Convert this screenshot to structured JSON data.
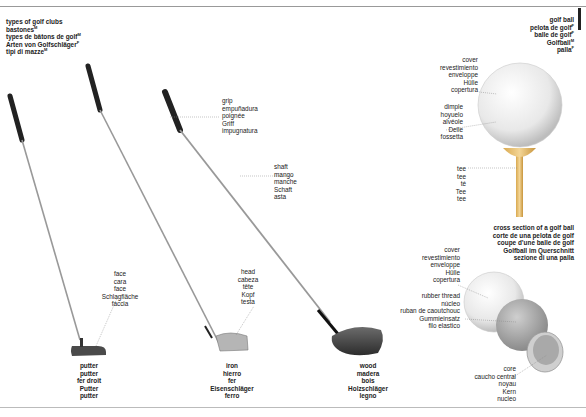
{
  "page_number": "golf",
  "title": {
    "lines": [
      {
        "text": "types of golf clubs",
        "gender": ""
      },
      {
        "text": "bastones",
        "gender": "M"
      },
      {
        "text": "types de bâtons de golf",
        "gender": "M"
      },
      {
        "text": "Arten von Golfschläger",
        "gender": "F"
      },
      {
        "text": "tipi di mazze",
        "gender": "M"
      }
    ]
  },
  "golf_ball_title": {
    "lines": [
      {
        "text": "golf ball",
        "gender": ""
      },
      {
        "text": "pelota de golf",
        "gender": "F"
      },
      {
        "text": "balle de golf",
        "gender": "F"
      },
      {
        "text": "Golfball",
        "gender": "M"
      },
      {
        "text": "palla",
        "gender": "F"
      }
    ]
  },
  "labels": {
    "grip": [
      "grip",
      "empuñadura",
      "poignée",
      "Griff",
      "impugnatura"
    ],
    "shaft": [
      "shaft",
      "mango",
      "manche",
      "Schaft",
      "asta"
    ],
    "face": [
      "face",
      "cara",
      "face",
      "Schlagfläche",
      "faccia"
    ],
    "head": [
      "head",
      "cabeza",
      "tête",
      "Kopf",
      "testa"
    ],
    "cover_top": [
      "cover",
      "revestimiento",
      "enveloppe",
      "Hülle",
      "copertura"
    ],
    "dimple": [
      "dimple",
      "hoyuelo",
      "alvéole",
      "Delle",
      "fossetta"
    ],
    "tee": [
      "tee",
      "tee",
      "té",
      "Tee",
      "tee"
    ],
    "cover_bottom": [
      "cover",
      "revestimiento",
      "enveloppe",
      "Hülle",
      "copertura"
    ],
    "rubber_thread": [
      "rubber thread",
      "núcleo",
      "ruban de caoutchouc",
      "Gummieinsatz",
      "filo elastico"
    ],
    "core": [
      "core",
      "caucho central",
      "noyau",
      "Kern",
      "nucleo"
    ]
  },
  "clubs": {
    "putter": [
      "putter",
      "putter",
      "fer droit",
      "Putter",
      "putter"
    ],
    "iron": [
      "iron",
      "hierro",
      "fer",
      "Eisenschläger",
      "ferro"
    ],
    "wood": [
      "wood",
      "madera",
      "bois",
      "Holzschläger",
      "legno"
    ]
  },
  "cross_section_title": {
    "lines": [
      "cross section of a golf ball",
      "corte de una pelota de golf",
      "coupe d’une balle de golf",
      "Golfball im Querschnitt",
      "sezione di una palla"
    ]
  },
  "colors": {
    "text": "#222222",
    "leader": "#888888",
    "club_head": "#555555",
    "ball": "#eeeeee",
    "tee": "#e8c070"
  }
}
